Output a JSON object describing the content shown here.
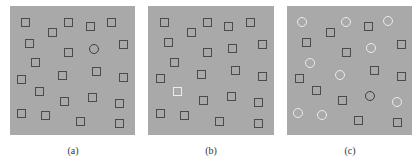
{
  "figure": {
    "background_color": "#a9a9a9",
    "dark_stroke_color": "#4b4b4b",
    "light_stroke_color": "#ececec",
    "panels": [
      {
        "id": "a",
        "label": "(a)",
        "box": {
          "x": 10,
          "y": 6,
          "w": 125,
          "h": 129
        },
        "label_x": 53,
        "shapes": [
          {
            "type": "square",
            "tone": "dark",
            "x": 21,
            "y": 18
          },
          {
            "type": "square",
            "tone": "dark",
            "x": 64,
            "y": 18
          },
          {
            "type": "square",
            "tone": "dark",
            "x": 86,
            "y": 22
          },
          {
            "type": "square",
            "tone": "dark",
            "x": 107,
            "y": 18
          },
          {
            "type": "square",
            "tone": "dark",
            "x": 48,
            "y": 28
          },
          {
            "type": "square",
            "tone": "dark",
            "x": 25,
            "y": 39
          },
          {
            "type": "square",
            "tone": "dark",
            "x": 64,
            "y": 48
          },
          {
            "type": "circle",
            "tone": "dark",
            "x": 89,
            "y": 44
          },
          {
            "type": "square",
            "tone": "dark",
            "x": 119,
            "y": 40
          },
          {
            "type": "square",
            "tone": "dark",
            "x": 31,
            "y": 58
          },
          {
            "type": "square",
            "tone": "dark",
            "x": 17,
            "y": 75
          },
          {
            "type": "square",
            "tone": "dark",
            "x": 58,
            "y": 71
          },
          {
            "type": "square",
            "tone": "dark",
            "x": 92,
            "y": 67
          },
          {
            "type": "square",
            "tone": "dark",
            "x": 119,
            "y": 73
          },
          {
            "type": "square",
            "tone": "dark",
            "x": 35,
            "y": 87
          },
          {
            "type": "square",
            "tone": "dark",
            "x": 60,
            "y": 97
          },
          {
            "type": "square",
            "tone": "dark",
            "x": 88,
            "y": 93
          },
          {
            "type": "square",
            "tone": "dark",
            "x": 115,
            "y": 99
          },
          {
            "type": "square",
            "tone": "dark",
            "x": 17,
            "y": 109
          },
          {
            "type": "square",
            "tone": "dark",
            "x": 41,
            "y": 111
          },
          {
            "type": "square",
            "tone": "dark",
            "x": 76,
            "y": 117
          },
          {
            "type": "square",
            "tone": "dark",
            "x": 115,
            "y": 119
          }
        ]
      },
      {
        "id": "b",
        "label": "(b)",
        "box": {
          "x": 148,
          "y": 6,
          "w": 126,
          "h": 129
        },
        "label_x": 191,
        "shapes": [
          {
            "type": "square",
            "tone": "dark",
            "x": 160,
            "y": 18
          },
          {
            "type": "square",
            "tone": "dark",
            "x": 203,
            "y": 18
          },
          {
            "type": "square",
            "tone": "dark",
            "x": 224,
            "y": 22
          },
          {
            "type": "square",
            "tone": "dark",
            "x": 246,
            "y": 18
          },
          {
            "type": "square",
            "tone": "dark",
            "x": 187,
            "y": 28
          },
          {
            "type": "square",
            "tone": "dark",
            "x": 164,
            "y": 38
          },
          {
            "type": "square",
            "tone": "dark",
            "x": 203,
            "y": 48
          },
          {
            "type": "square",
            "tone": "dark",
            "x": 228,
            "y": 44
          },
          {
            "type": "square",
            "tone": "dark",
            "x": 258,
            "y": 40
          },
          {
            "type": "square",
            "tone": "dark",
            "x": 170,
            "y": 58
          },
          {
            "type": "square",
            "tone": "dark",
            "x": 156,
            "y": 74
          },
          {
            "type": "square",
            "tone": "dark",
            "x": 197,
            "y": 70
          },
          {
            "type": "square",
            "tone": "dark",
            "x": 231,
            "y": 66
          },
          {
            "type": "square",
            "tone": "dark",
            "x": 258,
            "y": 72
          },
          {
            "type": "square",
            "tone": "light",
            "x": 173,
            "y": 87
          },
          {
            "type": "square",
            "tone": "dark",
            "x": 199,
            "y": 96
          },
          {
            "type": "square",
            "tone": "dark",
            "x": 227,
            "y": 92
          },
          {
            "type": "square",
            "tone": "dark",
            "x": 254,
            "y": 98
          },
          {
            "type": "square",
            "tone": "dark",
            "x": 156,
            "y": 109
          },
          {
            "type": "square",
            "tone": "dark",
            "x": 180,
            "y": 111
          },
          {
            "type": "square",
            "tone": "dark",
            "x": 215,
            "y": 117
          },
          {
            "type": "square",
            "tone": "dark",
            "x": 254,
            "y": 119
          }
        ]
      },
      {
        "id": "c",
        "label": "(c)",
        "box": {
          "x": 287,
          "y": 6,
          "w": 125,
          "h": 129
        },
        "label_x": 330,
        "shapes": [
          {
            "type": "circle",
            "tone": "light",
            "x": 297,
            "y": 17
          },
          {
            "type": "circle",
            "tone": "light",
            "x": 341,
            "y": 17
          },
          {
            "type": "square",
            "tone": "dark",
            "x": 364,
            "y": 22
          },
          {
            "type": "circle",
            "tone": "light",
            "x": 383,
            "y": 16
          },
          {
            "type": "square",
            "tone": "dark",
            "x": 326,
            "y": 28
          },
          {
            "type": "square",
            "tone": "dark",
            "x": 302,
            "y": 38
          },
          {
            "type": "square",
            "tone": "dark",
            "x": 342,
            "y": 48
          },
          {
            "type": "circle",
            "tone": "light",
            "x": 366,
            "y": 43
          },
          {
            "type": "square",
            "tone": "dark",
            "x": 397,
            "y": 40
          },
          {
            "type": "circle",
            "tone": "light",
            "x": 305,
            "y": 58
          },
          {
            "type": "square",
            "tone": "dark",
            "x": 370,
            "y": 66
          },
          {
            "type": "circle",
            "tone": "light",
            "x": 335,
            "y": 70
          },
          {
            "type": "square",
            "tone": "dark",
            "x": 295,
            "y": 74
          },
          {
            "type": "square",
            "tone": "dark",
            "x": 397,
            "y": 72
          },
          {
            "type": "square",
            "tone": "dark",
            "x": 312,
            "y": 86
          },
          {
            "type": "circle",
            "tone": "dark",
            "x": 365,
            "y": 91
          },
          {
            "type": "square",
            "tone": "dark",
            "x": 338,
            "y": 96
          },
          {
            "type": "circle",
            "tone": "light",
            "x": 392,
            "y": 97
          },
          {
            "type": "circle",
            "tone": "light",
            "x": 293,
            "y": 108
          },
          {
            "type": "circle",
            "tone": "light",
            "x": 317,
            "y": 110
          },
          {
            "type": "square",
            "tone": "dark",
            "x": 354,
            "y": 116
          },
          {
            "type": "square",
            "tone": "dark",
            "x": 393,
            "y": 118
          }
        ]
      }
    ]
  }
}
